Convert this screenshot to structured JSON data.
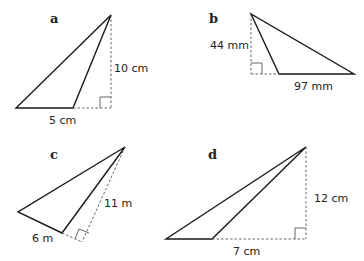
{
  "figure": {
    "parts": [
      {
        "id": "a",
        "label": "a",
        "base_label": "5 cm",
        "height_label": "10 cm"
      },
      {
        "id": "b",
        "label": "b",
        "base_label": "97 mm",
        "height_label": "44 mm"
      },
      {
        "id": "c",
        "label": "c",
        "base_label": "6 m",
        "height_label": "11 m"
      },
      {
        "id": "d",
        "label": "d",
        "base_label": "7 cm",
        "height_label": "12 cm"
      }
    ]
  },
  "colors": {
    "line": "#1a1a1a",
    "dashed": "#555555",
    "background": "#ffffff"
  }
}
